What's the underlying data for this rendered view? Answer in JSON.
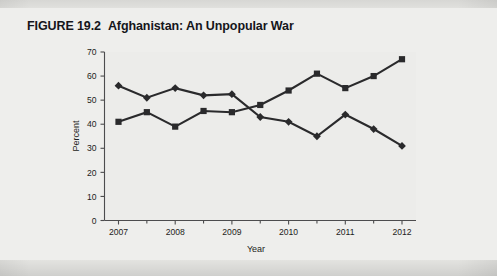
{
  "figure": {
    "label": "FIGURE 19.2",
    "title": "Afghanistan: An Unpopular War"
  },
  "chart_data": {
    "type": "line",
    "title": "Afghanistan: An Unpopular War",
    "xlabel": "Year",
    "ylabel": "Percent",
    "ylim": [
      0,
      70
    ],
    "yticks": [
      0,
      10,
      20,
      30,
      40,
      50,
      60,
      70
    ],
    "xtick_labels": [
      "2007",
      "2008",
      "2009",
      "2010",
      "2011",
      "2012"
    ],
    "xtick_values": [
      2007,
      2008,
      2009,
      2010,
      2011,
      2012
    ],
    "grid": false,
    "legend": "none",
    "x": [
      2007.0,
      2007.5,
      2008.0,
      2008.5,
      2009.0,
      2009.5,
      2010.0,
      2010.5,
      2011.0,
      2011.5,
      2012.0
    ],
    "series": [
      {
        "name": "Worth fighting",
        "marker": "diamond",
        "color": "#2a2a2c",
        "values": [
          56,
          51,
          55,
          52,
          52.5,
          43,
          41,
          35,
          44,
          38,
          31
        ]
      },
      {
        "name": "Not worth fighting",
        "marker": "square",
        "color": "#2a2a2c",
        "values": [
          41,
          45,
          39,
          45.5,
          45,
          48,
          54,
          61,
          55,
          60,
          67
        ]
      }
    ]
  }
}
